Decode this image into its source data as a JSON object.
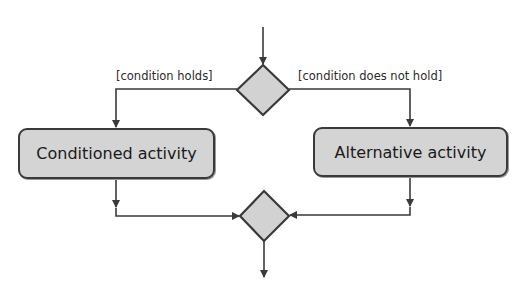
{
  "diagram": {
    "type": "UML activity diagram - decision and merge",
    "colors": {
      "node_fill": "#d4d4d4",
      "node_border": "#3a3a3a",
      "edge": "#3a3a3a",
      "text": "#1a1a1a",
      "background": "#ffffff"
    },
    "decision_node": {
      "kind": "decision",
      "center": [
        263,
        90
      ]
    },
    "merge_node": {
      "kind": "merge",
      "center": [
        264,
        216
      ]
    },
    "activities": [
      {
        "id": "conditioned",
        "label": "Conditioned activity"
      },
      {
        "id": "alternative",
        "label": "Alternative activity"
      }
    ],
    "guards": [
      {
        "id": "holds",
        "label": "[condition holds]"
      },
      {
        "id": "not_holds",
        "label": "[condition does not hold]"
      }
    ],
    "edges": [
      {
        "from": "start",
        "to": "decision"
      },
      {
        "from": "decision",
        "to": "conditioned",
        "guard": "[condition holds]"
      },
      {
        "from": "decision",
        "to": "alternative",
        "guard": "[condition does not hold]"
      },
      {
        "from": "conditioned",
        "to": "merge"
      },
      {
        "from": "alternative",
        "to": "merge"
      },
      {
        "from": "merge",
        "to": "end"
      }
    ]
  }
}
